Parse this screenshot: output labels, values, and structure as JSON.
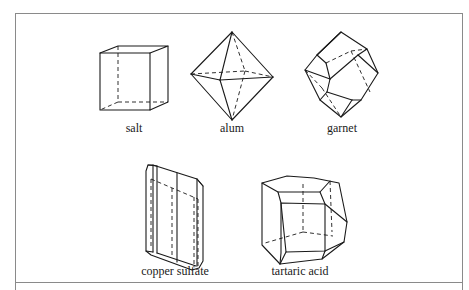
{
  "figure": {
    "crystals": [
      {
        "id": "salt",
        "label": "salt",
        "shape": "cube"
      },
      {
        "id": "alum",
        "label": "alum",
        "shape": "octahedron"
      },
      {
        "id": "garnet",
        "label": "garnet",
        "shape": "rhombic dodecahedron"
      },
      {
        "id": "copper-sulfate",
        "label": "copper sulfate",
        "shape": "triclinic prism"
      },
      {
        "id": "tartaric-acid",
        "label": "tartaric acid",
        "shape": "monoclinic polyhedron"
      }
    ]
  }
}
